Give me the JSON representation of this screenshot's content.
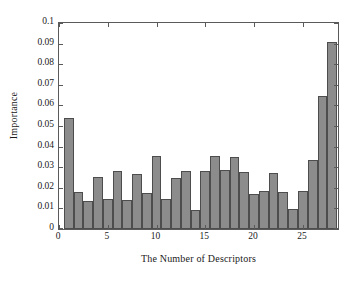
{
  "chart_data": {
    "type": "bar",
    "title": "",
    "subtitle": "",
    "xlabel": "The Number of Descriptors",
    "ylabel": "Importance",
    "xlim": [
      0,
      28.6
    ],
    "ylim": [
      0,
      0.1
    ],
    "grid": false,
    "legend": null,
    "legend_position": "none",
    "bar_fill_color": "#8c8c8c",
    "bar_edge_color": "#4d4d4d",
    "axis_color": "#5a5a5a",
    "background_color": "#ffffff",
    "x_tick_labels": [
      "0",
      "5",
      "10",
      "15",
      "20",
      "25"
    ],
    "x_tick_values": [
      0,
      5,
      10,
      15,
      20,
      25
    ],
    "y_tick_labels": [
      "0",
      "0.01",
      "0.02",
      "0.03",
      "0.04",
      "0.05",
      "0.06",
      "0.07",
      "0.08",
      "0.09",
      "0.1"
    ],
    "y_tick_values": [
      0,
      0.01,
      0.02,
      0.03,
      0.04,
      0.05,
      0.06,
      0.07,
      0.08,
      0.09,
      0.1
    ],
    "categories": [
      1,
      2,
      3,
      4,
      5,
      6,
      7,
      8,
      9,
      10,
      11,
      12,
      13,
      14,
      15,
      16,
      17,
      18,
      19,
      20,
      21,
      22,
      23,
      24,
      25,
      26,
      27,
      28
    ],
    "values": [
      0.0537,
      0.0178,
      0.0137,
      0.0253,
      0.0145,
      0.0281,
      0.0143,
      0.0266,
      0.0175,
      0.0353,
      0.0148,
      0.0248,
      0.0282,
      0.0094,
      0.028,
      0.0353,
      0.0288,
      0.035,
      0.0279,
      0.0171,
      0.0183,
      0.0273,
      0.018,
      0.0096,
      0.0183,
      0.0337,
      0.0645,
      0.0908
    ]
  }
}
